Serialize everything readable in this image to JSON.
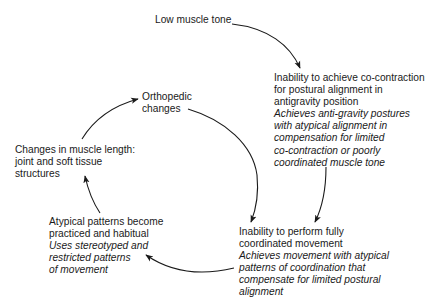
{
  "diagram": {
    "type": "cycle",
    "nodes": {
      "low_tone": {
        "label": [
          "Low muscle tone"
        ],
        "detail": []
      },
      "cocontraction": {
        "label": [
          "Inability to achieve co-contraction",
          "for postural alignment in",
          "antigravity position"
        ],
        "detail": [
          "Achieves anti-gravity postures",
          "with atypical alignment in",
          "compensation for limited",
          "co-contraction or poorly",
          "coordinated muscle tone"
        ]
      },
      "coordination": {
        "label": [
          "Inability to perform fully",
          "coordinated movement"
        ],
        "detail": [
          "Achieves movement with atypical",
          "patterns of coordination that",
          "compensate for limited postural",
          "alignment"
        ]
      },
      "habitual": {
        "label": [
          "Atypical patterns become",
          "practiced and habitual"
        ],
        "detail": [
          "Uses stereotyped and",
          "restricted patterns",
          "of movement"
        ]
      },
      "muscle_length": {
        "label": [
          "Changes in muscle length:",
          "joint and soft tissue",
          "structures"
        ],
        "detail": []
      },
      "orthopedic": {
        "label": [
          "Orthopedic",
          "changes"
        ],
        "detail": []
      }
    },
    "edges": [
      {
        "from": "low_tone",
        "to": "cocontraction"
      },
      {
        "from": "cocontraction",
        "to": "coordination"
      },
      {
        "from": "orthopedic",
        "to": "coordination"
      },
      {
        "from": "coordination",
        "to": "habitual"
      },
      {
        "from": "habitual",
        "to": "muscle_length"
      },
      {
        "from": "muscle_length",
        "to": "orthopedic"
      }
    ]
  }
}
